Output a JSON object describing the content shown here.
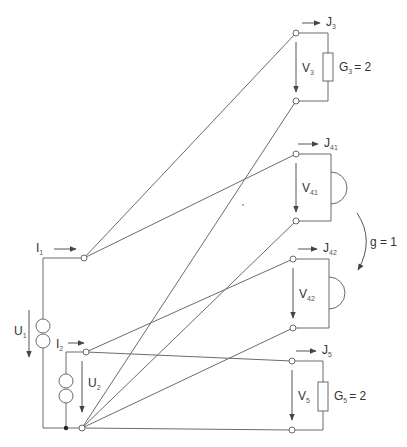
{
  "diagram": {
    "type": "electrical-circuit-graph",
    "sources": [
      {
        "id": "source-1",
        "current_label": "I",
        "current_sub": "1",
        "voltage_label": "U",
        "voltage_sub": "1"
      },
      {
        "id": "source-2",
        "current_label": "I",
        "current_sub": "2",
        "voltage_label": "U",
        "voltage_sub": "2"
      }
    ],
    "ports": [
      {
        "id": "port-3",
        "current_label": "J",
        "current_sub": "3",
        "voltage_label": "V",
        "voltage_sub": "3",
        "element": "resistor",
        "element_label": "G",
        "element_sub": "3",
        "element_value": "= 2"
      },
      {
        "id": "port-41",
        "current_label": "J",
        "current_sub": "41",
        "voltage_label": "V",
        "voltage_sub": "41",
        "element": "gyrator-port"
      },
      {
        "id": "port-42",
        "current_label": "J",
        "current_sub": "42",
        "voltage_label": "V",
        "voltage_sub": "42",
        "element": "gyrator-port"
      },
      {
        "id": "port-5",
        "current_label": "J",
        "current_sub": "5",
        "voltage_label": "V",
        "voltage_sub": "5",
        "element": "resistor",
        "element_label": "G",
        "element_sub": "5",
        "element_value": "= 2"
      }
    ],
    "gyrator": {
      "label": "g = 1"
    },
    "colors": {
      "wire": "#6b6b6b",
      "text": "#333333"
    }
  }
}
